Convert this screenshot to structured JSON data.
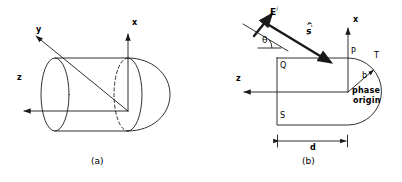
{
  "figure": {
    "panels": [
      {
        "id": "a",
        "caption": "(a)",
        "description": "finite cylinder with hemispherical end cap and 3-D axes",
        "axes": [
          {
            "name": "x-axis",
            "label": "x"
          },
          {
            "name": "y-axis",
            "label": "y"
          },
          {
            "name": "z-axis",
            "label": "z"
          }
        ]
      },
      {
        "id": "b",
        "caption": "(b)",
        "description": "cross-section showing incident plane wave, angle of incidence and phase origin",
        "axes": [
          {
            "name": "x-axis",
            "label": "x"
          },
          {
            "name": "z-axis",
            "label": "z"
          }
        ],
        "vectors": {
          "incident_field_label": "E",
          "incident_field_superscript": "i",
          "propagation_label": "s",
          "propagation_superscript": "'",
          "angle_label": "θ"
        },
        "points": {
          "p": "P",
          "q": "Q",
          "s": "S",
          "t": "T"
        },
        "dimensions": {
          "radius_label": "b",
          "length_label": "d"
        },
        "annotations": {
          "phase_origin_line1": "phase",
          "phase_origin_line2": "origin"
        }
      }
    ]
  },
  "colors": {
    "stroke": "#1a1a1a",
    "background": "#ffffff"
  }
}
